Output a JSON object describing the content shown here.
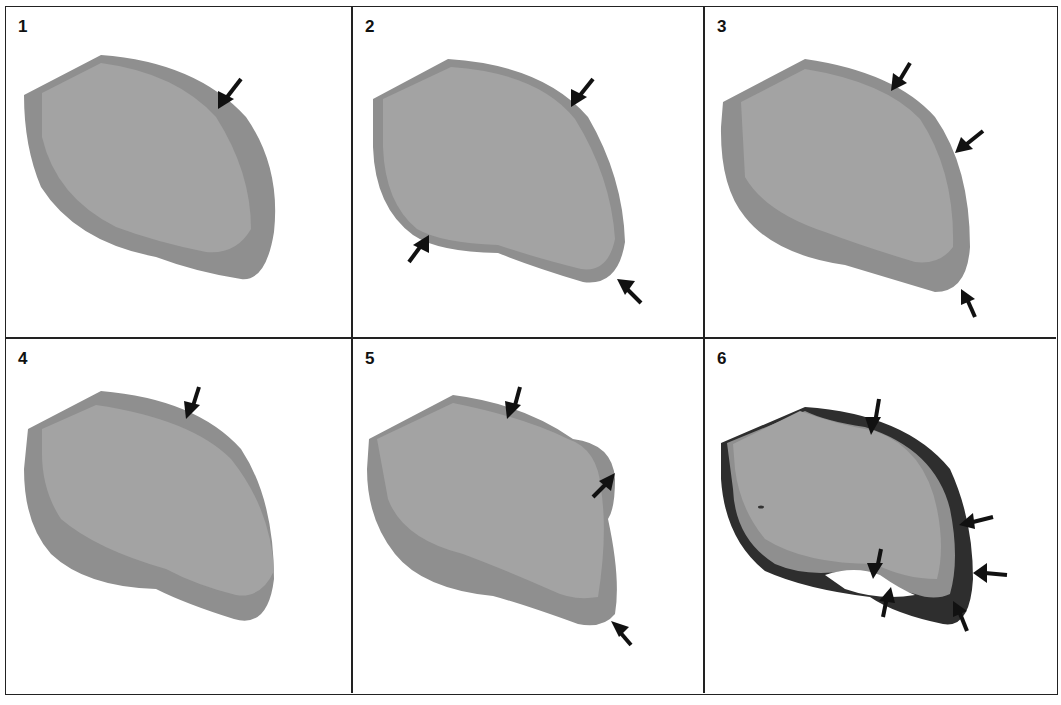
{
  "figure": {
    "colors": {
      "outer_layer": "#8f8f8f",
      "inner_core": "#a3a3a3",
      "dark_layer": "#2e2e2e",
      "arrow": "#111111",
      "border": "#222222"
    },
    "panels": [
      {
        "label": "1",
        "arrow_count": 1
      },
      {
        "label": "2",
        "arrow_count": 3
      },
      {
        "label": "3",
        "arrow_count": 3
      },
      {
        "label": "4",
        "arrow_count": 1
      },
      {
        "label": "5",
        "arrow_count": 3
      },
      {
        "label": "6",
        "arrow_count": 6
      }
    ]
  }
}
